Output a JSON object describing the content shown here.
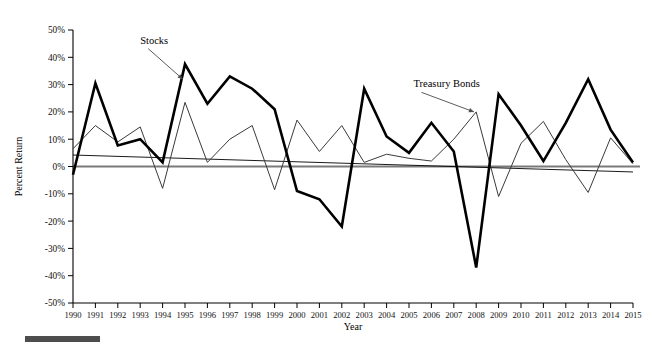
{
  "figure": {
    "background_color": "#ffffff",
    "caption_bar_color": "#4d4d4d"
  },
  "chart_data": {
    "type": "line",
    "title": "",
    "xlabel": "Year",
    "ylabel": "Percent Return",
    "xlim": [
      1990,
      2015
    ],
    "ylim": [
      -50,
      50
    ],
    "grid": false,
    "legend_position": "inline-annotations",
    "ytick_labels": [
      "50%",
      "40%",
      "30%",
      "20%",
      "10%",
      "0%",
      "-10%",
      "-20%",
      "-30%",
      "-40%",
      "-50%"
    ],
    "ytick_values": [
      50,
      40,
      30,
      20,
      10,
      0,
      -10,
      -20,
      -30,
      -40,
      -50
    ],
    "categories": [
      "1990",
      "1991",
      "1992",
      "1993",
      "1994",
      "1995",
      "1996",
      "1997",
      "1998",
      "1999",
      "2000",
      "2001",
      "2002",
      "2003",
      "2004",
      "2005",
      "2006",
      "2007",
      "2008",
      "2009",
      "2010",
      "2011",
      "2012",
      "2013",
      "2014",
      "2015"
    ],
    "x": [
      1990,
      1991,
      1992,
      1993,
      1994,
      1995,
      1996,
      1997,
      1998,
      1999,
      2000,
      2001,
      2002,
      2003,
      2004,
      2005,
      2006,
      2007,
      2008,
      2009,
      2010,
      2011,
      2012,
      2013,
      2014,
      2015
    ],
    "series": [
      {
        "name": "Stocks",
        "color": "#000000",
        "line_width": "thick",
        "values": [
          -3,
          30.5,
          7.7,
          10,
          1.5,
          37.5,
          23,
          33,
          28.5,
          21,
          -9,
          -12,
          -22,
          28.5,
          11,
          5,
          16,
          5.5,
          -37,
          26.5,
          15,
          2,
          16,
          32,
          13.5,
          1.5
        ]
      },
      {
        "name": "Treasury Bonds",
        "color": "#3a3a3a",
        "line_width": "thin",
        "values": [
          6.5,
          15,
          9,
          14.5,
          -8,
          23.5,
          1.5,
          10,
          15,
          -8.5,
          17,
          5.5,
          15,
          1.5,
          4.5,
          3,
          2,
          10,
          20,
          -11,
          8.5,
          16.5,
          2.5,
          -9.5,
          10.5,
          1
        ]
      }
    ],
    "annotations": [
      {
        "text": "Stocks",
        "label_x": 1993.0,
        "label_y": 45,
        "point_x": 1994.9,
        "point_y": 32
      },
      {
        "text": "Treasury Bonds",
        "label_x": 2005.2,
        "label_y": 29,
        "point_x": 2007.9,
        "point_y": 20
      }
    ],
    "trend_line": {
      "name": "trend",
      "x": [
        1990,
        2015
      ],
      "y": [
        4.2,
        -2.0
      ]
    },
    "zero_line": {
      "name": "zero-reference",
      "y": 0,
      "color": "#7a7a7a"
    }
  }
}
